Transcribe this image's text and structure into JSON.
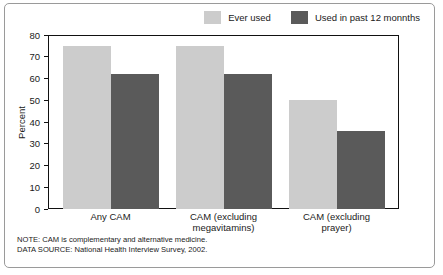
{
  "chart_data": {
    "type": "bar",
    "title": "",
    "xlabel": "",
    "ylabel": "Percent",
    "ylim": [
      0,
      80
    ],
    "yticks": [
      0,
      10,
      20,
      30,
      40,
      50,
      60,
      70,
      80
    ],
    "grid": false,
    "legend_position": "top-right",
    "categories": [
      "Any CAM",
      "CAM (excluding megavitamins)",
      "CAM (excluding prayer)"
    ],
    "category_lines": [
      [
        "Any CAM"
      ],
      [
        "CAM (excluding",
        "megavitamins)"
      ],
      [
        "CAM (excluding",
        "prayer)"
      ]
    ],
    "series": [
      {
        "name": "Ever used",
        "color": "#cccccc",
        "values": [
          75,
          75,
          50
        ]
      },
      {
        "name": "Used in past 12 monnths",
        "color": "#5a5a5a",
        "values": [
          62,
          62,
          36
        ]
      }
    ],
    "notes": [
      "NOTE: CAM is complementary and alternative medicine.",
      "DATA SOURCE: National Health Interview Survey, 2002."
    ]
  }
}
